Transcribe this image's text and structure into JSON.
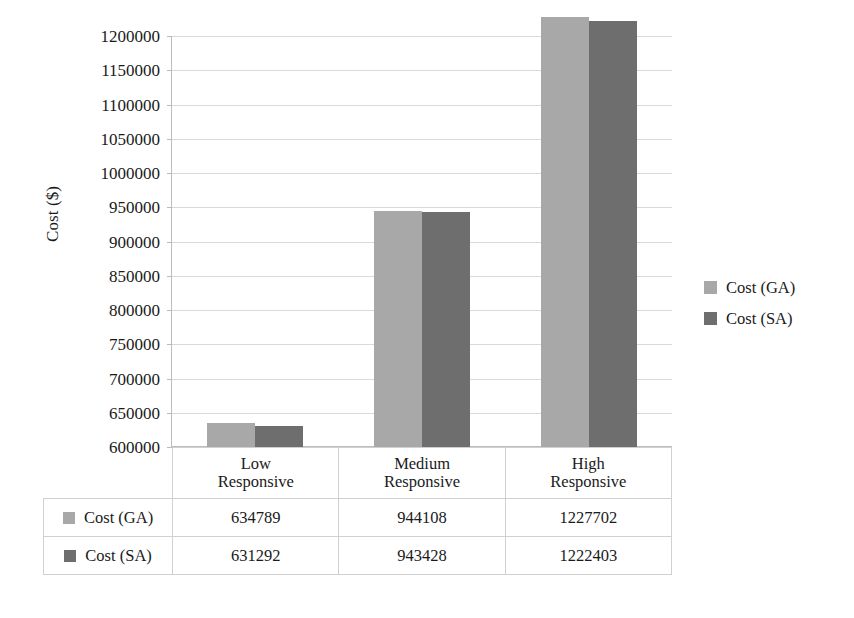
{
  "chart_data": {
    "type": "bar",
    "title": "",
    "subtitle": "",
    "xlabel": "",
    "ylabel": "Cost ($)",
    "categories": [
      "Low\nResponsive",
      "Medium\nResponsive",
      "High\nResponsive"
    ],
    "category_lines": [
      [
        "Low",
        "Responsive"
      ],
      [
        "Medium",
        "Responsive"
      ],
      [
        "High",
        "Responsive"
      ]
    ],
    "series": [
      {
        "name": "Cost (GA)",
        "color": "#a8a8a8",
        "values": [
          634789,
          944108,
          1227702
        ]
      },
      {
        "name": "Cost (SA)",
        "color": "#6e6e6e",
        "values": [
          631292,
          943428,
          1222403
        ]
      }
    ],
    "ylim": [
      600000,
      1200000
    ],
    "ytick_step": 50000,
    "yticks": [
      "1200000",
      "1150000",
      "1100000",
      "1050000",
      "1000000",
      "950000",
      "900000",
      "850000",
      "800000",
      "750000",
      "700000",
      "650000",
      "600000"
    ],
    "ytick_values": [
      1200000,
      1150000,
      1100000,
      1050000,
      1000000,
      950000,
      900000,
      850000,
      800000,
      750000,
      700000,
      650000,
      600000
    ],
    "grid": true,
    "grid_axis": "y",
    "legend_position": "right",
    "legend": [
      "Cost (GA)",
      "Cost (SA)"
    ],
    "data_table_visible": true
  },
  "table": {
    "row_headers": [
      "Cost (GA)",
      "Cost (SA)"
    ],
    "rows": [
      {
        "label": "Cost (GA)",
        "color": "#a8a8a8",
        "cells": [
          "634789",
          "944108",
          "1227702"
        ]
      },
      {
        "label": "Cost (SA)",
        "color": "#6e6e6e",
        "cells": [
          "631292",
          "943428",
          "1222403"
        ]
      }
    ]
  },
  "axis": {
    "y_title": "Cost ($)"
  }
}
